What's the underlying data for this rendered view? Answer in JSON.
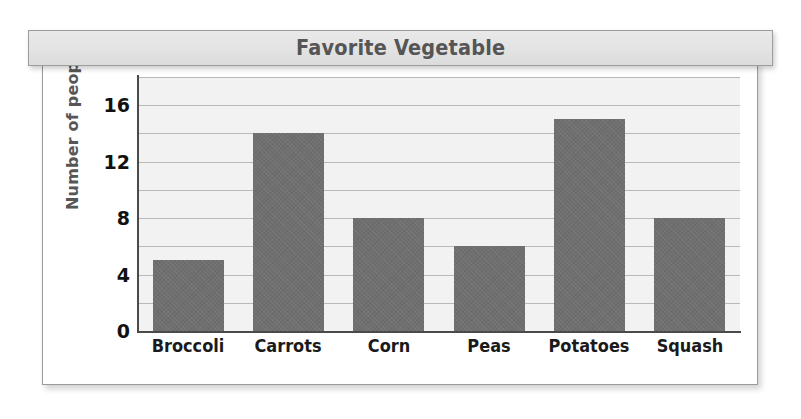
{
  "title_banner": {
    "title": "Favorite Vegetable"
  },
  "chart_data": {
    "type": "bar",
    "title": "Favorite Vegetable",
    "xlabel": "",
    "ylabel": "Number of people",
    "categories": [
      "Broccoli",
      "Carrots",
      "Corn",
      "Peas",
      "Potatoes",
      "Squash"
    ],
    "values": [
      5,
      14,
      8,
      6,
      15,
      8
    ],
    "ylim": [
      0,
      18
    ],
    "yticks": [
      0,
      4,
      8,
      12,
      16
    ],
    "ytick_labels": [
      "0",
      "4",
      "8",
      "12",
      "16"
    ],
    "gridlines_every": 2,
    "grid": true,
    "legend": "none",
    "bar_color": "#6f6f6f",
    "plot_background": "#f2f2f2",
    "gridline_color": "#b9b9b9",
    "axis_color": "#4a4a4a",
    "title_color": "#555555",
    "ylabel_color": "#565656"
  }
}
